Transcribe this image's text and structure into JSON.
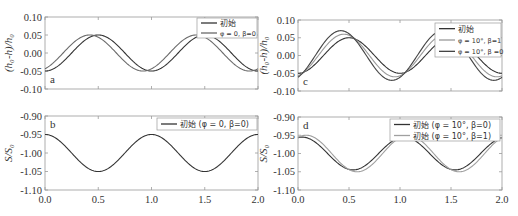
{
  "chart_data": [
    {
      "panel": "a",
      "type": "line",
      "ylabel": "(h0-h)/h0",
      "xlabel": "",
      "xlim": [
        0.0,
        2.0
      ],
      "ylim": [
        -0.1,
        0.1
      ],
      "yticks": [
        "0.10",
        "0.05",
        "0.00",
        "-0.05",
        "-0.10"
      ],
      "xticks": [
        0.0,
        0.5,
        1.0,
        1.5,
        2.0
      ],
      "legend_position": "upper right",
      "series": [
        {
          "name": "初始",
          "color": "#333333",
          "amplitude": 0.05,
          "phase_shift": 0.0,
          "x": [
            0.0,
            0.25,
            0.5,
            0.75,
            1.0,
            1.25,
            1.5,
            1.75,
            2.0
          ],
          "values": [
            -0.05,
            0.0,
            0.05,
            0.0,
            -0.05,
            0.0,
            0.05,
            0.0,
            -0.05
          ]
        },
        {
          "name": "φ = 0, β=0",
          "color": "#6a6a6a",
          "amplitude": 0.05,
          "phase_shift": -0.08,
          "x": [
            0.0,
            0.25,
            0.5,
            0.75,
            1.0,
            1.25,
            1.5,
            1.75,
            2.0
          ],
          "values": [
            -0.044,
            0.024,
            0.044,
            -0.024,
            -0.044,
            0.024,
            0.044,
            -0.024,
            -0.044
          ]
        }
      ]
    },
    {
      "panel": "b",
      "type": "line",
      "ylabel": "S/S0",
      "xlabel": "",
      "xlim": [
        0.0,
        2.0
      ],
      "ylim": [
        -1.1,
        -0.9
      ],
      "yticks": [
        "-0.90",
        "-0.95",
        "-1.00",
        "-1.05",
        "-1.10"
      ],
      "xticks": [
        "0.0",
        "0.5",
        "1.0",
        "1.5",
        "2.0"
      ],
      "legend_position": "upper right",
      "series": [
        {
          "name": "初始 (φ = 0, β=0)",
          "color": "#333333",
          "amplitude": 0.05,
          "phase_shift": 0.0,
          "x": [
            0.0,
            0.25,
            0.5,
            0.75,
            1.0,
            1.25,
            1.5,
            1.75,
            2.0
          ],
          "values": [
            -0.95,
            -1.0,
            -1.05,
            -1.0,
            -0.95,
            -1.0,
            -1.05,
            -1.0,
            -0.95
          ]
        }
      ]
    },
    {
      "panel": "c",
      "type": "line",
      "ylabel": "(h0-h)/h0",
      "xlabel": "",
      "xlim": [
        0.0,
        2.0
      ],
      "ylim": [
        -0.1,
        0.1
      ],
      "yticks": [
        "0.10",
        "0.05",
        "0.00",
        "-0.05",
        "-0.10"
      ],
      "xticks": [
        0.0,
        0.5,
        1.0,
        1.5,
        2.0
      ],
      "legend_position": "upper right",
      "series": [
        {
          "name": "初始",
          "color": "#333333",
          "amplitude": 0.05,
          "phase_shift": 0.0,
          "x": [
            0.0,
            0.25,
            0.5,
            0.75,
            1.0,
            1.25,
            1.5,
            1.75,
            2.0
          ],
          "values": [
            -0.05,
            0.0,
            0.05,
            0.0,
            -0.05,
            0.0,
            0.05,
            0.0,
            -0.05
          ]
        },
        {
          "name": "φ = 10°, β=1",
          "color": "#9a9a9a",
          "amplitude": 0.06,
          "phase_shift": -0.05,
          "x": [
            0.0,
            0.25,
            0.5,
            0.75,
            1.0,
            1.25,
            1.5,
            1.75,
            2.0
          ],
          "values": [
            -0.057,
            0.019,
            0.057,
            -0.019,
            -0.057,
            0.019,
            0.057,
            -0.019,
            -0.057
          ]
        },
        {
          "name": "φ = 10°, β =0",
          "color": "#444444",
          "amplitude": 0.07,
          "phase_shift": -0.08,
          "x": [
            0.0,
            0.25,
            0.5,
            0.75,
            1.0,
            1.25,
            1.5,
            1.75,
            2.0
          ],
          "values": [
            -0.061,
            0.034,
            0.061,
            -0.034,
            -0.061,
            0.034,
            0.061,
            -0.034,
            -0.061
          ]
        }
      ]
    },
    {
      "panel": "d",
      "type": "line",
      "ylabel": "S/S0",
      "xlabel": "",
      "xlim": [
        0.0,
        2.0
      ],
      "ylim": [
        -1.1,
        -0.9
      ],
      "yticks": [
        "-0.90",
        "-0.95",
        "-1.00",
        "-1.05",
        "-1.10"
      ],
      "xticks": [
        "0.0",
        "0.5",
        "1.0",
        "1.5",
        "2.0"
      ],
      "legend_position": "upper right",
      "series": [
        {
          "name": "初始 (φ = 10°, β=0)",
          "color": "#333333",
          "amplitude": 0.045,
          "phase_shift": 0.04,
          "x": [
            0.0,
            0.25,
            0.5,
            0.75,
            1.0,
            1.25,
            1.5,
            1.75,
            2.0
          ],
          "values": [
            -0.958,
            -1.011,
            -1.042,
            -0.989,
            -0.958,
            -1.011,
            -1.042,
            -0.989,
            -0.958
          ]
        },
        {
          "name": "初始 (φ = 10°, β=1)",
          "color": "#a0a0a0",
          "amplitude": 0.05,
          "phase_shift": 0.08,
          "x": [
            0.0,
            0.25,
            0.5,
            0.75,
            1.0,
            1.25,
            1.5,
            1.75,
            2.0
          ],
          "values": [
            -0.956,
            -1.024,
            -1.044,
            -0.976,
            -0.956,
            -1.024,
            -1.044,
            -0.976,
            -0.956
          ]
        }
      ]
    }
  ],
  "panels": {
    "a": {
      "letter": "a",
      "ylabel_main": "(h",
      "ylabel": "(h₀-h)/h₀",
      "legend": [
        "初始",
        "φ = 0, β=0"
      ]
    },
    "b": {
      "letter": "b",
      "ylabel": "S/S₀",
      "legend": [
        "初始 (φ = 0, β=0)"
      ]
    },
    "c": {
      "letter": "c",
      "ylabel": "(h₀-h)/h₀",
      "legend": [
        "初始",
        "φ = 10°, β=1",
        "φ = 10°, β =0"
      ]
    },
    "d": {
      "letter": "d",
      "ylabel": "S/S₀",
      "legend": [
        "初始 (φ = 10°, β=0)",
        "初始 (φ = 10°, β=1)"
      ]
    }
  },
  "ticks": {
    "y_top": [
      "0.10",
      "0.05",
      "0.00",
      "-0.05",
      "-0.10"
    ],
    "y_bottom": [
      "-0.90",
      "-0.95",
      "-1.00",
      "-1.05",
      "-1.10"
    ],
    "x": [
      "0.0",
      "0.5",
      "1.0",
      "1.5",
      "2.0"
    ]
  }
}
